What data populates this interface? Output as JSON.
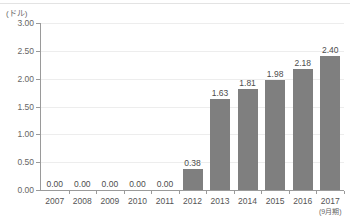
{
  "chart_data": {
    "type": "bar",
    "title": "",
    "subtitle": "",
    "unit_label": "(ドル)",
    "xlabel": "",
    "ylabel": "",
    "categories": [
      "2007",
      "2008",
      "2009",
      "2010",
      "2011",
      "2012",
      "2013",
      "2014",
      "2015",
      "2016",
      "2017"
    ],
    "category_sublabels": [
      "",
      "",
      "",
      "",
      "",
      "",
      "",
      "",
      "",
      "",
      "(9月期)"
    ],
    "values": [
      0.0,
      0.0,
      0.0,
      0.0,
      0.0,
      0.38,
      1.63,
      1.81,
      1.98,
      2.18,
      2.4
    ],
    "value_labels": [
      "0.00",
      "0.00",
      "0.00",
      "0.00",
      "0.00",
      "0.38",
      "1.63",
      "1.81",
      "1.98",
      "2.18",
      "2.40"
    ],
    "ylim": [
      0.0,
      3.0
    ],
    "yticks": [
      0.0,
      0.5,
      1.0,
      1.5,
      2.0,
      2.5,
      3.0
    ],
    "ytick_labels": [
      "0.00",
      "0.50",
      "1.00",
      "1.50",
      "2.00",
      "2.50",
      "3.00"
    ],
    "grid": true,
    "legend": false,
    "legend_position": "none",
    "bar_color": "#7f7f7f",
    "grid_color": "#ededed",
    "axis_color": "#9a9a9a",
    "text_color": "#555555"
  }
}
